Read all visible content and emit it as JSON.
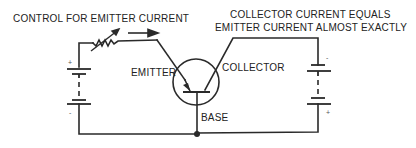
{
  "diagram": {
    "title_left": "CONTROL FOR EMITTER CURRENT",
    "title_right_line1": "COLLECTOR CURRENT EQUALS",
    "title_right_line2": "EMITTER CURRENT ALMOST EXACTLY",
    "labels": {
      "emitter": "EMITTER",
      "collector": "COLLECTOR",
      "base": "BASE"
    },
    "left_battery": {
      "top_sign": "+",
      "bottom_sign": "-"
    },
    "right_battery": {
      "top_sign": "-",
      "bottom_sign": "+"
    },
    "colors": {
      "line": "#2a2a2a",
      "background": "#ffffff"
    }
  }
}
